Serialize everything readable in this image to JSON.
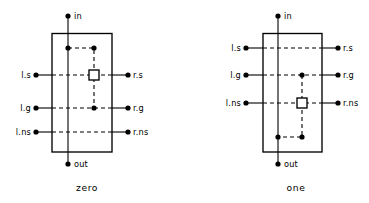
{
  "figure": {
    "title": "",
    "background_color": "#ffffff",
    "ink_color": "#000000",
    "width": 369,
    "height": 203
  },
  "cells": [
    {
      "id": "zero",
      "caption": "zero",
      "caption_x": 87,
      "caption_y": 191,
      "box": {
        "x": 52,
        "y": 33.5,
        "width": 60,
        "height": 118.5
      },
      "spine_x": 68,
      "ports": {
        "top": {
          "label": "in",
          "dot_x": 68,
          "dot_y": 16,
          "label_x": 74,
          "label_y": 19
        },
        "bottom": {
          "label": "out",
          "dot_x": 68,
          "dot_y": 164,
          "label_x": 74,
          "label_y": 167
        },
        "left": [
          {
            "label": "l.s",
            "dot_x": 36,
            "dot_y": 75,
            "label_x": 31,
            "label_y": 78
          },
          {
            "label": "l.g",
            "dot_x": 36,
            "dot_y": 108,
            "label_x": 31,
            "label_y": 111
          },
          {
            "label": "l.ns",
            "dot_x": 36,
            "dot_y": 132,
            "label_x": 31,
            "label_y": 135
          }
        ],
        "right": [
          {
            "label": "r.s",
            "dot_x": 128,
            "dot_y": 75,
            "label_x": 133,
            "label_y": 78
          },
          {
            "label": "r.g",
            "dot_x": 128,
            "dot_y": 108,
            "label_x": 133,
            "label_y": 111
          },
          {
            "label": "r.ns",
            "dot_x": 128,
            "dot_y": 132,
            "label_x": 133,
            "label_y": 135
          }
        ]
      },
      "switch_square": {
        "cx": 94,
        "cy": 75,
        "size": 10
      },
      "internal_dots": [
        {
          "cx": 68,
          "cy": 48
        },
        {
          "cx": 94,
          "cy": 48
        },
        {
          "cx": 94,
          "cy": 108
        }
      ],
      "internal_dashed_path": "M 68 48 L 94 48 L 94 108",
      "row_wires": [
        {
          "name": "l.s-to-r.s",
          "y": 75
        },
        {
          "name": "l.g-to-r.g",
          "y": 108
        },
        {
          "name": "l.ns-to-r.ns",
          "y": 132
        }
      ]
    },
    {
      "id": "one",
      "caption": "one",
      "caption_x": 296,
      "caption_y": 191,
      "box": {
        "x": 263,
        "y": 33.5,
        "width": 59,
        "height": 118.5
      },
      "spine_x": 278,
      "ports": {
        "top": {
          "label": "in",
          "dot_x": 278,
          "dot_y": 16,
          "label_x": 284,
          "label_y": 19
        },
        "bottom": {
          "label": "out",
          "dot_x": 278,
          "dot_y": 164,
          "label_x": 284,
          "label_y": 167
        },
        "left": [
          {
            "label": "l.s",
            "dot_x": 246,
            "dot_y": 48,
            "label_x": 241,
            "label_y": 51
          },
          {
            "label": "l.g",
            "dot_x": 246,
            "dot_y": 75,
            "label_x": 241,
            "label_y": 78
          },
          {
            "label": "l.ns",
            "dot_x": 246,
            "dot_y": 103,
            "label_x": 241,
            "label_y": 106
          }
        ],
        "right": [
          {
            "label": "r.s",
            "dot_x": 338,
            "dot_y": 48,
            "label_x": 343,
            "label_y": 51
          },
          {
            "label": "r.g",
            "dot_x": 338,
            "dot_y": 75,
            "label_x": 343,
            "label_y": 78
          },
          {
            "label": "r.ns",
            "dot_x": 338,
            "dot_y": 103,
            "label_x": 343,
            "label_y": 106
          }
        ]
      },
      "switch_square": {
        "cx": 302,
        "cy": 103,
        "size": 10
      },
      "internal_dots": [
        {
          "cx": 302,
          "cy": 75
        },
        {
          "cx": 302,
          "cy": 137
        },
        {
          "cx": 278,
          "cy": 137
        }
      ],
      "internal_dashed_path": "M 302 75 L 302 137 L 278 137",
      "row_wires": [
        {
          "name": "l.s-to-r.s",
          "y": 48
        },
        {
          "name": "l.g-to-r.g",
          "y": 75
        },
        {
          "name": "l.ns-to-r.ns",
          "y": 103
        }
      ]
    }
  ]
}
